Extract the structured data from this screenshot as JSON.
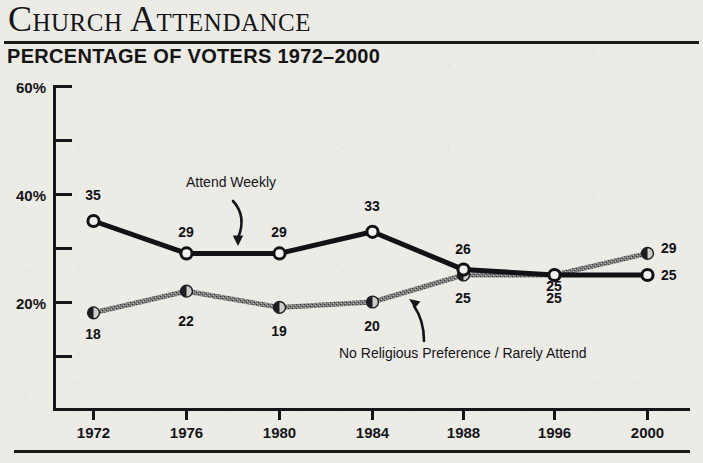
{
  "header": {
    "title": "Church Attendance",
    "subtitle": "PERCENTAGE OF VOTERS 1972–2000"
  },
  "colors": {
    "paper": "#edebe6",
    "ink": "#15151a",
    "series_weekly": "#111116",
    "series_none": "#6e6e6e"
  },
  "annotations": {
    "weekly": "Attend Weekly",
    "none": "No Religious Preference / Rarely Attend"
  },
  "chart_data": {
    "type": "line",
    "title": "Church Attendance",
    "subtitle": "PERCENTAGE OF VOTERS 1972–2000",
    "xlabel": "",
    "ylabel": "",
    "ylim": [
      0,
      60
    ],
    "grid": false,
    "legend": "inline-annotations",
    "y_ticks_major": [
      "20%",
      "40%",
      "60%"
    ],
    "y_tick_values_major": [
      20,
      40,
      60
    ],
    "y_tick_values_minor": [
      10,
      30,
      50
    ],
    "categories": [
      "1972",
      "1976",
      "1980",
      "1984",
      "1988",
      "1996",
      "2000"
    ],
    "series": [
      {
        "name": "Attend Weekly",
        "color": "#111116",
        "marker": "open-circle",
        "values": [
          35,
          29,
          29,
          33,
          26,
          25,
          25
        ],
        "labels": [
          "35",
          "29",
          "29",
          "33",
          "26",
          "25",
          "25"
        ],
        "label_side": [
          "above",
          "above",
          "above",
          "above",
          "above",
          "above",
          "right"
        ]
      },
      {
        "name": "No Religious Preference / Rarely Attend",
        "color": "#6e6e6e",
        "marker": "filled-circle",
        "values": [
          18,
          22,
          19,
          20,
          25,
          25,
          29
        ],
        "labels": [
          "18",
          "22",
          "19",
          "20",
          "25",
          "25",
          "29"
        ],
        "label_side": [
          "below",
          "below",
          "below",
          "below",
          "below",
          "below",
          "right"
        ]
      }
    ]
  }
}
